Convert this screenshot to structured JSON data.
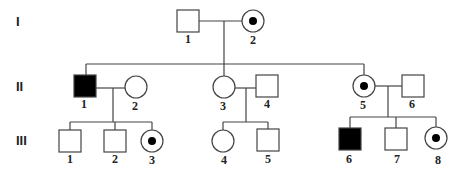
{
  "diagram": {
    "type": "pedigree",
    "generations": [
      {
        "label": "I",
        "y": 21
      },
      {
        "label": "II",
        "y": 86
      },
      {
        "label": "III",
        "y": 140
      }
    ],
    "individuals": [
      {
        "id": "I-1",
        "label": "1",
        "sex": "male",
        "status": "unaffected"
      },
      {
        "id": "I-2",
        "label": "2",
        "sex": "female",
        "status": "carrier"
      },
      {
        "id": "II-1",
        "label": "1",
        "sex": "male",
        "status": "affected"
      },
      {
        "id": "II-2",
        "label": "2",
        "sex": "female",
        "status": "unaffected"
      },
      {
        "id": "II-3",
        "label": "3",
        "sex": "female",
        "status": "unaffected"
      },
      {
        "id": "II-4",
        "label": "4",
        "sex": "male",
        "status": "unaffected"
      },
      {
        "id": "II-5",
        "label": "5",
        "sex": "female",
        "status": "carrier"
      },
      {
        "id": "II-6",
        "label": "6",
        "sex": "male",
        "status": "unaffected"
      },
      {
        "id": "III-1",
        "label": "1",
        "sex": "male",
        "status": "unaffected"
      },
      {
        "id": "III-2",
        "label": "2",
        "sex": "male",
        "status": "unaffected"
      },
      {
        "id": "III-3",
        "label": "3",
        "sex": "female",
        "status": "carrier"
      },
      {
        "id": "III-4",
        "label": "4",
        "sex": "female",
        "status": "unaffected"
      },
      {
        "id": "III-5",
        "label": "5",
        "sex": "male",
        "status": "unaffected"
      },
      {
        "id": "III-6",
        "label": "6",
        "sex": "male",
        "status": "affected"
      },
      {
        "id": "III-7",
        "label": "7",
        "sex": "male",
        "status": "unaffected"
      },
      {
        "id": "III-8",
        "label": "8",
        "sex": "female",
        "status": "carrier"
      }
    ],
    "matings": [
      {
        "partners": [
          "I-1",
          "I-2"
        ],
        "children": [
          "II-1",
          "II-3",
          "II-5"
        ]
      },
      {
        "partners": [
          "II-1",
          "II-2"
        ],
        "children": [
          "III-1",
          "III-2",
          "III-3"
        ]
      },
      {
        "partners": [
          "II-3",
          "II-4"
        ],
        "children": [
          "III-4",
          "III-5"
        ]
      },
      {
        "partners": [
          "II-5",
          "II-6"
        ],
        "children": [
          "III-6",
          "III-7",
          "III-8"
        ]
      }
    ],
    "colors": {
      "line": "#444444",
      "affected_fill": "#000000",
      "background": "#ffffff"
    }
  }
}
